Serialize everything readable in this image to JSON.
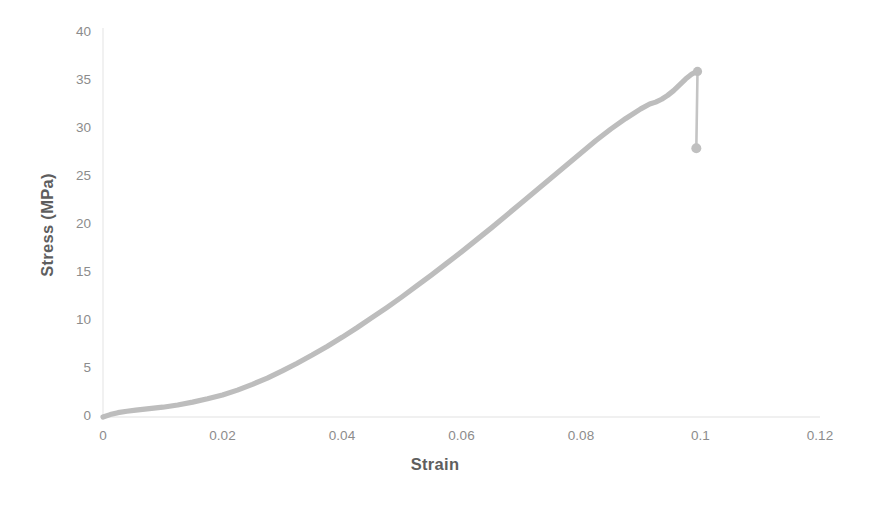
{
  "chart_data": {
    "type": "line",
    "title": "",
    "xlabel": "Strain",
    "ylabel": "Stress (MPa)",
    "xlim": [
      0,
      0.12
    ],
    "ylim": [
      0,
      40
    ],
    "xticks": [
      "0",
      "0.02",
      "0.04",
      "0.06",
      "0.08",
      "0.1",
      "0.12"
    ],
    "xtick_values": [
      0,
      0.02,
      0.04,
      0.06,
      0.08,
      0.1,
      0.12
    ],
    "yticks": [
      "0",
      "5",
      "10",
      "15",
      "20",
      "25",
      "30",
      "35",
      "40"
    ],
    "ytick_values": [
      0,
      5,
      10,
      15,
      20,
      25,
      30,
      35,
      40
    ],
    "grid": false,
    "legend": false,
    "series": [
      {
        "name": "Stress-Strain",
        "color": "#bdbdbd",
        "x": [
          0.0,
          0.0012,
          0.0025,
          0.004,
          0.0055,
          0.007,
          0.0085,
          0.01,
          0.0125,
          0.015,
          0.0175,
          0.02,
          0.0225,
          0.025,
          0.0275,
          0.03,
          0.0325,
          0.035,
          0.0375,
          0.04,
          0.0425,
          0.045,
          0.0475,
          0.05,
          0.0525,
          0.055,
          0.0575,
          0.06,
          0.0625,
          0.065,
          0.0675,
          0.07,
          0.0725,
          0.075,
          0.0775,
          0.08,
          0.0825,
          0.085,
          0.0875,
          0.09,
          0.0915,
          0.0925,
          0.0935,
          0.0945,
          0.0955,
          0.0965,
          0.0975,
          0.0985,
          0.0992,
          0.0995
        ],
        "y": [
          0.0,
          0.25,
          0.45,
          0.6,
          0.72,
          0.82,
          0.92,
          1.02,
          1.25,
          1.55,
          1.9,
          2.3,
          2.8,
          3.4,
          4.05,
          4.8,
          5.6,
          6.45,
          7.35,
          8.3,
          9.3,
          10.35,
          11.4,
          12.5,
          13.65,
          14.8,
          16.0,
          17.2,
          18.45,
          19.7,
          21.0,
          22.3,
          23.6,
          24.9,
          26.2,
          27.5,
          28.8,
          30.0,
          31.1,
          32.1,
          32.6,
          32.8,
          33.1,
          33.5,
          34.0,
          34.6,
          35.2,
          35.7,
          35.95,
          36.0
        ]
      }
    ],
    "annotations": [
      {
        "name": "peak-point",
        "label": "peak stress",
        "x": 0.0995,
        "y": 36.0,
        "marker": "circle"
      },
      {
        "name": "failure-drop",
        "label": "failure drop",
        "x": 0.0995,
        "y_from": 36.0,
        "y_to": 28.0
      },
      {
        "name": "fracture-point",
        "label": "fracture stress",
        "x": 0.0993,
        "y": 28.0,
        "marker": "circle"
      }
    ]
  },
  "style": {
    "curve_color": "#bdbdbd",
    "axis_color": "#ebebeb",
    "tick_text_color": "#8c8c8c",
    "title_text_color": "#5e5e5e",
    "background": "#ffffff"
  }
}
